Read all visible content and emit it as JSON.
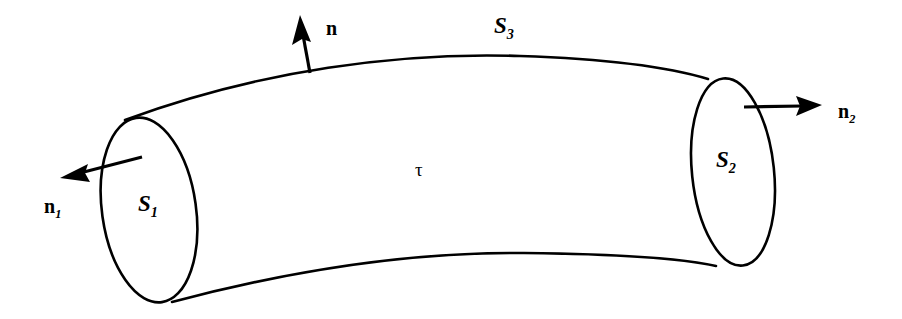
{
  "figure": {
    "background_color": "#ffffff",
    "stroke_color": "#000000",
    "width": 902,
    "height": 319
  },
  "labels": {
    "normal_top": {
      "symbol": "n",
      "subscript": "",
      "x": 326,
      "y": 18
    },
    "normal_left": {
      "symbol": "n",
      "subscript": "1",
      "x": 44,
      "y": 196
    },
    "normal_right": {
      "symbol": "n",
      "subscript": "2",
      "x": 838,
      "y": 101
    },
    "surface_top": {
      "symbol": "S",
      "subscript": "3",
      "x": 494,
      "y": 14
    },
    "surface_left": {
      "symbol": "S",
      "subscript": "1",
      "x": 138,
      "y": 192
    },
    "surface_right": {
      "symbol": "S",
      "subscript": "2",
      "x": 716,
      "y": 148
    },
    "volume": {
      "symbol": "τ",
      "subscript": "",
      "x": 415,
      "y": 160
    }
  },
  "geometry": {
    "tube_top_curve": "M 125,120 C 260,70 400,52 520,56 C 610,59 672,68 708,79",
    "tube_bottom_curve": "M 172,302 C 300,268 420,252 524,253 C 620,254 684,259 716,266",
    "cap_left": {
      "cx": 149,
      "cy": 210,
      "rx": 47,
      "ry": 93,
      "rotation": -8
    },
    "cap_right": {
      "cx": 733,
      "cy": 172,
      "rx": 41,
      "ry": 94,
      "rotation": -6
    },
    "arrow_top": {
      "x1": 310,
      "y1": 73,
      "x2": 301,
      "y2": 24
    },
    "arrow_left": {
      "x1": 142,
      "y1": 157,
      "x2": 66,
      "y2": 177
    },
    "arrow_right": {
      "x1": 744,
      "y1": 107,
      "x2": 818,
      "y2": 105
    }
  }
}
